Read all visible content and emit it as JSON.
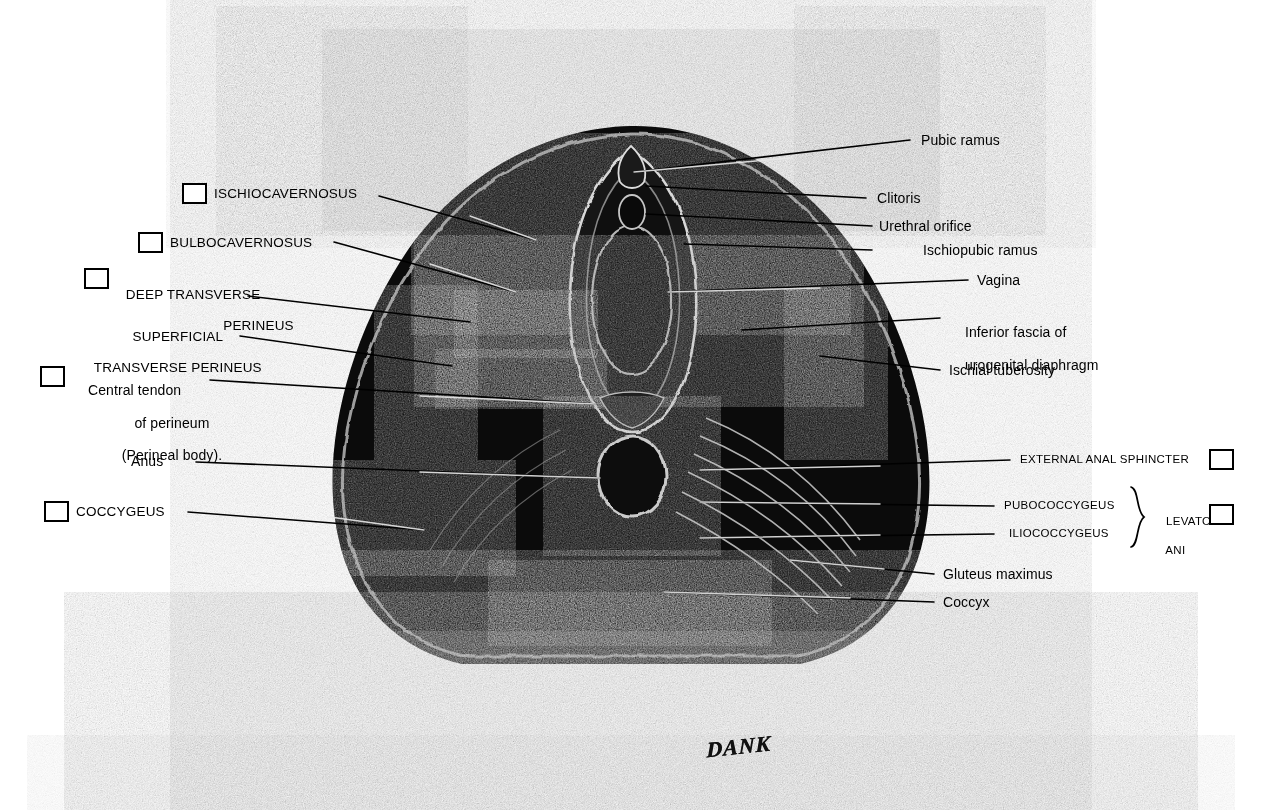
{
  "plate": {
    "title": "Female Perineum — Superficial and Deep Muscles",
    "signature": "DANK",
    "background_color": "#ffffff",
    "ink_color": "#000000"
  },
  "labels_left": [
    {
      "id": "ischiocavernosus",
      "text": "ISCHIOCAVERNOSUS",
      "style": "caps",
      "has_checkbox": true
    },
    {
      "id": "bulbocavernosus",
      "text": "BULBOCAVERNOSUS",
      "style": "caps",
      "has_checkbox": true
    },
    {
      "id": "deep-transverse-perineus",
      "line1": "DEEP TRANSVERSE",
      "line2": "PERINEUS",
      "style": "caps",
      "has_checkbox": true
    },
    {
      "id": "superficial-transverse-perineus",
      "line1": "SUPERFICIAL",
      "line2": "TRANSVERSE PERINEUS",
      "style": "caps",
      "has_checkbox": false
    },
    {
      "id": "central-tendon-of-perineum",
      "line1": "Central tendon",
      "line2": "of perineum",
      "line3": "(Perineal body).",
      "style": "mixed",
      "has_checkbox": true
    },
    {
      "id": "anus",
      "text": "Anus",
      "style": "mixed",
      "has_checkbox": false
    },
    {
      "id": "coccygeus",
      "text": "COCCYGEUS",
      "style": "caps",
      "has_checkbox": true
    }
  ],
  "labels_right": [
    {
      "id": "pubic-ramus",
      "text": "Pubic ramus",
      "style": "mixed",
      "has_checkbox": false
    },
    {
      "id": "clitoris",
      "text": "Clitoris",
      "style": "mixed",
      "has_checkbox": false
    },
    {
      "id": "urethral-orifice",
      "text": "Urethral orifice",
      "style": "mixed",
      "has_checkbox": false
    },
    {
      "id": "ischiopubic-ramus",
      "text": "Ischiopubic ramus",
      "style": "mixed",
      "has_checkbox": false
    },
    {
      "id": "vagina",
      "text": "Vagina",
      "style": "mixed",
      "has_checkbox": false
    },
    {
      "id": "inferior-fascia-of-urogenital-diaphragm",
      "line1": "Inferior fascia of",
      "line2": "urogenital diaphragm",
      "style": "mixed",
      "has_checkbox": false
    },
    {
      "id": "ischial-tuberosity",
      "text": "Ischial tuberosity",
      "style": "mixed",
      "has_checkbox": false
    },
    {
      "id": "external-anal-sphincter",
      "text": "EXTERNAL ANAL SPHINCTER",
      "style": "caps-sm",
      "has_checkbox": true
    },
    {
      "id": "pubococcygeus",
      "text": "PUBOCOCCYGEUS",
      "style": "caps-sm",
      "has_checkbox": false
    },
    {
      "id": "iliococcygeus",
      "text": "ILIOCOCCYGEUS",
      "style": "caps-sm",
      "has_checkbox": false
    },
    {
      "id": "gluteus-maximus",
      "text": "Gluteus maximus",
      "style": "mixed",
      "has_checkbox": false
    },
    {
      "id": "coccyx",
      "text": "Coccyx",
      "style": "mixed",
      "has_checkbox": false
    }
  ],
  "group_label": {
    "id": "levator-ani",
    "line1": "LEVATOR",
    "line2": "ANI",
    "members": [
      "PUBOCOCCYGEUS",
      "ILIOCOCCYGEUS"
    ],
    "has_checkbox": true
  },
  "checkbox_count": 8,
  "anatomy_regions": [
    "pubic ramus",
    "clitoris",
    "urethral orifice",
    "vagina",
    "ischiopubic ramus",
    "urogenital diaphragm",
    "ischial tuberosity",
    "anus",
    "external anal sphincter",
    "levator ani",
    "coccyx",
    "gluteus maximus",
    "thigh",
    "buttock"
  ]
}
